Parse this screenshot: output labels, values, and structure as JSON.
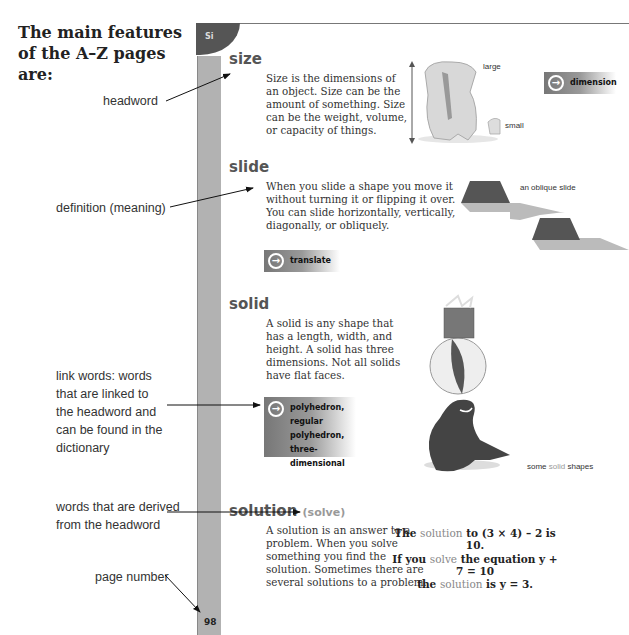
{
  "intro": {
    "title": "The main features of the A–Z pages are:"
  },
  "annotations": {
    "headword": "headword",
    "definition": "definition (meaning)",
    "link_words": [
      "link words: words",
      "that are linked to",
      "the headword and",
      "can be found in the",
      "dictionary"
    ],
    "derived": [
      "words that are derived",
      "from the headword"
    ],
    "page_number": "page number"
  },
  "page": {
    "tab_label": "Si",
    "page_number": "98",
    "colors": {
      "sidebar": "#b2b2b2",
      "tab": "#555555",
      "headword": "#555555"
    }
  },
  "entries": {
    "size": {
      "headword": "size",
      "definition": [
        "Size is the dimensions of",
        "an object. Size can be the",
        "amount of something. Size",
        "can be the weight, volume,",
        "or capacity of things."
      ],
      "link": "dimension",
      "captions": {
        "large": "large",
        "small": "small"
      }
    },
    "slide": {
      "headword": "slide",
      "definition": [
        "When you slide a shape you move it",
        "without turning it or flipping it over.",
        "You can slide horizontally, vertically,",
        "diagonally, or obliquely."
      ],
      "link": "translate",
      "caption": "an oblique slide"
    },
    "solid": {
      "headword": "solid",
      "definition": [
        "A solid is any shape that",
        "has a length, width, and",
        "height. A solid has three",
        "dimensions. Not all solids",
        "have flat faces."
      ],
      "links": [
        "polyhedron,",
        "regular polyhedron,",
        "three-dimensional"
      ],
      "caption": {
        "pre": "some ",
        "hl": "solid",
        "post": " shapes"
      }
    },
    "solution": {
      "headword": "solution",
      "derived": "(solve)",
      "definition": [
        "A solution is an answer to a",
        "problem. When you solve",
        "something you find the",
        "solution. Sometimes there are",
        "several solutions to a problem."
      ],
      "examples": [
        {
          "pre": "The ",
          "hl": "solution",
          "post": " to (3 × 4) – 2 is 10."
        },
        {
          "pre": "If you ",
          "hl": "solve",
          "post": " the equation y + 7 = 10"
        },
        {
          "pre": "the ",
          "hl": "solution",
          "post": " is y = 3."
        }
      ]
    }
  }
}
